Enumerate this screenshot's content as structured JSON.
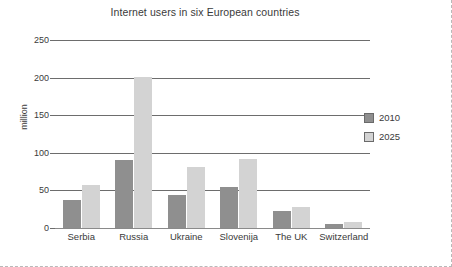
{
  "chart_data": {
    "type": "bar",
    "title": "Internet users in six European countries",
    "xlabel": "",
    "ylabel": "million",
    "categories": [
      "Serbia",
      "Russia",
      "Ukraine",
      "Slovenija",
      "The UK",
      "Switzerland"
    ],
    "series": [
      {
        "name": "2010",
        "values": [
          37,
          91,
          44,
          55,
          23,
          6
        ],
        "color": "#8f8f8f"
      },
      {
        "name": "2025",
        "values": [
          57,
          201,
          81,
          92,
          28,
          8
        ],
        "color": "#d3d3d3"
      }
    ],
    "ylim": [
      0,
      250
    ],
    "yticks": [
      0,
      50,
      100,
      150,
      200,
      250
    ],
    "ytick_labels": [
      "0",
      "50",
      "100",
      "150",
      "200",
      "250"
    ],
    "grid": true,
    "legend_position": "right",
    "legend_entries": [
      "2010",
      "2025"
    ]
  },
  "colors": {
    "series_2010": "#8f8f8f",
    "series_2025": "#d3d3d3",
    "gridline": "#6d6d6d",
    "text": "#3a3a3a",
    "frame_dashed": "#b9b9b9"
  }
}
